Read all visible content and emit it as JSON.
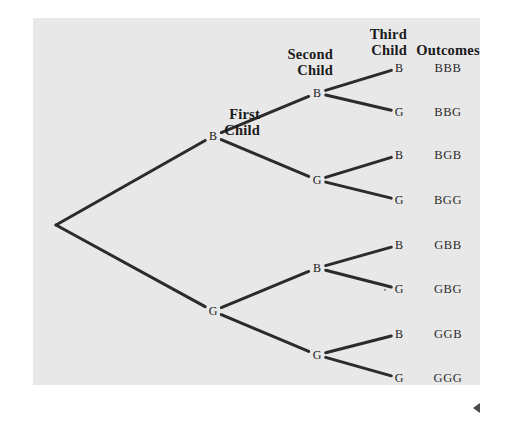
{
  "figure": {
    "background_color": "#ffffff",
    "panel_color": "#e8e8e8",
    "line_color": "#2b2b2b",
    "text_color": "#1a1a1a"
  },
  "headers": {
    "first_child": "First\nChild",
    "second_child": "Second\nChild",
    "third_child": "Third\nChild",
    "outcomes": "Outcomes"
  },
  "nodes": {
    "root": {
      "label": "",
      "x": 56,
      "y": 225
    },
    "level1": [
      {
        "id": "b",
        "label": "B",
        "x": 213,
        "y": 136
      },
      {
        "id": "g",
        "label": "G",
        "x": 213,
        "y": 311
      }
    ],
    "level2": [
      {
        "id": "bb",
        "label": "B",
        "x": 317,
        "y": 93
      },
      {
        "id": "bg",
        "label": "G",
        "x": 317,
        "y": 180
      },
      {
        "id": "gb",
        "label": "B",
        "x": 317,
        "y": 268
      },
      {
        "id": "gg",
        "label": "G",
        "x": 317,
        "y": 355
      }
    ],
    "level3": [
      {
        "id": "bbb",
        "label": "B",
        "x": 399,
        "y": 68
      },
      {
        "id": "bbg",
        "label": "G",
        "x": 399,
        "y": 112
      },
      {
        "id": "bgb",
        "label": "B",
        "x": 399,
        "y": 155
      },
      {
        "id": "bgg",
        "label": "G",
        "x": 399,
        "y": 200
      },
      {
        "id": "gbb",
        "label": "B",
        "x": 399,
        "y": 245
      },
      {
        "id": "gbg",
        "label": "G",
        "x": 399,
        "y": 289
      },
      {
        "id": "ggb",
        "label": "B",
        "x": 399,
        "y": 334
      },
      {
        "id": "ggg",
        "label": "G",
        "x": 399,
        "y": 378
      }
    ]
  },
  "outcomes": [
    {
      "text": "BBB",
      "y": 62
    },
    {
      "text": "BBG",
      "y": 106
    },
    {
      "text": "BGB",
      "y": 149
    },
    {
      "text": "BGG",
      "y": 194
    },
    {
      "text": "GBB",
      "y": 239
    },
    {
      "text": "GBG",
      "y": 283
    },
    {
      "text": "GGB",
      "y": 328
    },
    {
      "text": "GGG",
      "y": 372
    }
  ],
  "marker": {
    "name": "left-pointing-triangle"
  }
}
